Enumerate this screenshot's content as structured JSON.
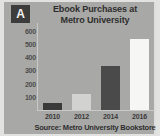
{
  "figure": {
    "badge_label": "A",
    "source_note": "Source: Metro University Bookstore",
    "colors": {
      "panel_background": "#a8a8a6",
      "outer_frame": "#e2e2e0",
      "badge_background": "#3c3c3c",
      "badge_text": "#f2f2f0",
      "title_text": "#2e2e2e",
      "axis_line": "#c9c9c7",
      "tick_text": "#4c4c4c"
    }
  },
  "chart_data": {
    "type": "bar",
    "title": "Ebook Purchases at Metro University",
    "title_lines": [
      "Ebook Purchases at",
      "Metro University"
    ],
    "xlabel": "",
    "ylabel": "",
    "categories": [
      "2010",
      "2012",
      "2014",
      "2016"
    ],
    "values": [
      50,
      120,
      330,
      540
    ],
    "bar_colors": [
      "#3a3a3a",
      "#d2d2d0",
      "#4a4a4a",
      "#f6f6f4"
    ],
    "ylim": [
      0,
      650
    ],
    "yticks": [
      600,
      500,
      400,
      300,
      200,
      100
    ],
    "ytick_labels": [
      "600",
      "500",
      "400",
      "300",
      "200",
      "100"
    ],
    "grid": false,
    "legend": "none",
    "annotations": [
      "Source: Metro University Bookstore"
    ]
  }
}
